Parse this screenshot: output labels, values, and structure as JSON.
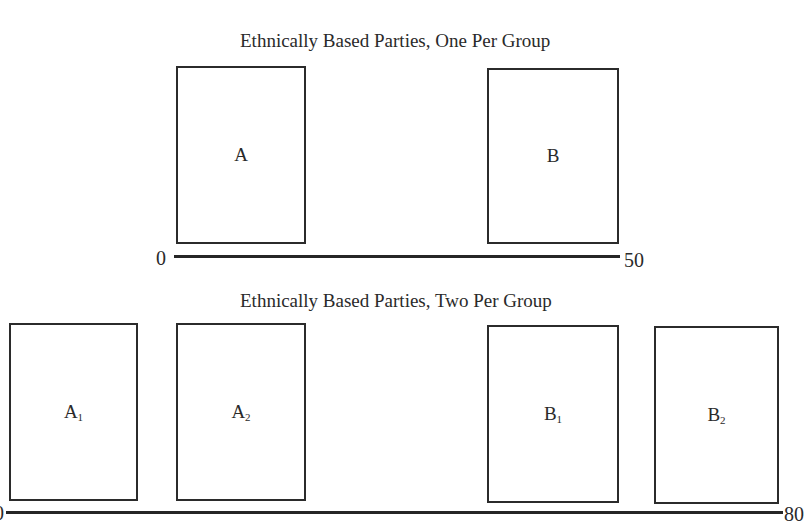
{
  "panels": [
    {
      "title": "Ethnically Based Parties, One Per Group",
      "axis": {
        "min_label": "0",
        "max_label": "50"
      },
      "parties": [
        {
          "label": "A",
          "sub": ""
        },
        {
          "label": "B",
          "sub": ""
        }
      ]
    },
    {
      "title": "Ethnically Based Parties, Two Per Group",
      "axis": {
        "min_label": "0",
        "max_label": "80"
      },
      "parties": [
        {
          "label": "A",
          "sub": "1"
        },
        {
          "label": "A",
          "sub": "2"
        },
        {
          "label": "B",
          "sub": "1"
        },
        {
          "label": "B",
          "sub": "2"
        }
      ]
    }
  ]
}
